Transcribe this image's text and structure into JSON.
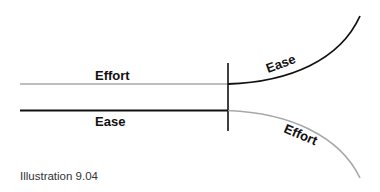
{
  "diagram": {
    "colors": {
      "effort": "#a8a8a8",
      "ease": "#111111",
      "divider": "#111111"
    },
    "left": {
      "top_label": "Effort",
      "bottom_label": "Ease"
    },
    "right": {
      "upper_curve_label": "Ease",
      "lower_curve_label": "Effort"
    },
    "caption": "Illustration 9.04"
  }
}
